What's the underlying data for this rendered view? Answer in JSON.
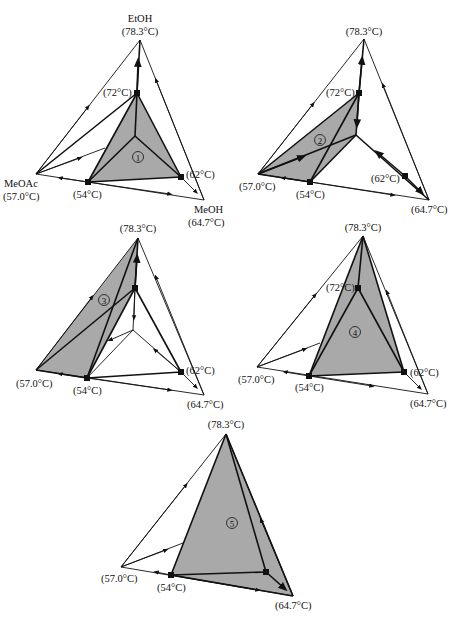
{
  "components": {
    "top": {
      "name": "EtOH",
      "bp": "(78.3°C)"
    },
    "left": {
      "name": "MeOAc",
      "bp": "(57.0°C)"
    },
    "right": {
      "name": "MeOH",
      "bp": "(64.7°C)"
    }
  },
  "azeotropes": {
    "a72": "(72°C)",
    "a54": "(54°C)",
    "a62": "(62°C)"
  },
  "diagrams": [
    {
      "id": 1,
      "region_label": "1",
      "labels": {
        "top": "(78.3°C)",
        "left": "(57.0°C)",
        "right": "(64.7°C)",
        "a72": "(72°C)",
        "a54": "(54°C)",
        "a62": "(62°C)"
      }
    },
    {
      "id": 2,
      "region_label": "2",
      "labels": {
        "top": "(78.3°C)",
        "left": "(57.0°C)",
        "right": "(64.7°C)",
        "a72": "(72°C)",
        "a54": "(54°C)",
        "a62": "(62°C)"
      }
    },
    {
      "id": 3,
      "region_label": "3",
      "labels": {
        "top": "(78.3°C)",
        "left": "(57.0°C)",
        "right": "(64.7°C)",
        "a54": "(54°C)",
        "a62": "(62°C)"
      }
    },
    {
      "id": 4,
      "region_label": "4",
      "labels": {
        "top": "(78.3°C)",
        "left": "(57.0°C)",
        "right": "(64.7°C)",
        "a72": "(72°C)",
        "a54": "(54°C)",
        "a62": "(62°C)"
      }
    },
    {
      "id": 5,
      "region_label": "5",
      "labels": {
        "top": "(78.3°C)",
        "left": "(57.0°C)",
        "right": "(64.7°C)",
        "a54": "(54°C)"
      }
    }
  ],
  "colors": {
    "shade": "#a9a9a9",
    "line": "#111111",
    "background": "#ffffff"
  }
}
